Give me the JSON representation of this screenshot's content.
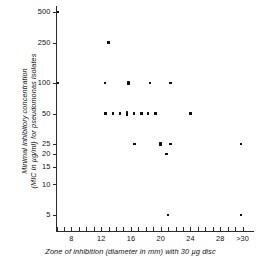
{
  "chart_data": {
    "type": "scatter",
    "title": "",
    "xlabel": "Zone of inhibition (diameter in mm) with 30 µg disc",
    "ylabel_line1": "Minimal inhibitory concentration",
    "ylabel_line2": "(MIC in µg/ml) for pseudomonas isolates",
    "yscale": "log",
    "ytick_labels": [
      "500",
      "250",
      "100",
      "50",
      "25",
      "20",
      "15",
      "10",
      "5"
    ],
    "ytick_values": [
      500,
      250,
      100,
      50,
      25,
      20,
      15,
      10,
      5
    ],
    "xtick_labels": [
      "8",
      "12",
      "16",
      "20",
      "24",
      "28",
      ">30"
    ],
    "xtick_values": [
      8,
      12,
      16,
      20,
      24,
      28,
      31
    ],
    "xlim": [
      6,
      32
    ],
    "ylim": [
      4,
      600
    ],
    "grid": false,
    "legend": null,
    "marker": "square",
    "marker_color": "#0d0d0d",
    "points": [
      {
        "x": 6.2,
        "y": 500,
        "count": 1
      },
      {
        "x": 13.0,
        "y": 250,
        "count": 1
      },
      {
        "x": 6.2,
        "y": 100,
        "count": 1
      },
      {
        "x": 12.5,
        "y": 100,
        "count": 1
      },
      {
        "x": 15.7,
        "y": 100,
        "count": 2
      },
      {
        "x": 18.6,
        "y": 100,
        "count": 1
      },
      {
        "x": 21.3,
        "y": 100,
        "count": 1
      },
      {
        "x": 12.6,
        "y": 50,
        "count": 1
      },
      {
        "x": 13.6,
        "y": 50,
        "count": 1
      },
      {
        "x": 14.5,
        "y": 50,
        "count": 1
      },
      {
        "x": 15.5,
        "y": 50,
        "count": 2
      },
      {
        "x": 16.4,
        "y": 50,
        "count": 1
      },
      {
        "x": 17.4,
        "y": 50,
        "count": 1
      },
      {
        "x": 18.3,
        "y": 50,
        "count": 1
      },
      {
        "x": 19.3,
        "y": 50,
        "count": 1
      },
      {
        "x": 24.0,
        "y": 50,
        "count": 1
      },
      {
        "x": 16.5,
        "y": 25,
        "count": 1
      },
      {
        "x": 20.0,
        "y": 25,
        "count": 2
      },
      {
        "x": 21.3,
        "y": 25,
        "count": 1
      },
      {
        "x": 30.8,
        "y": 25,
        "count": 1
      },
      {
        "x": 20.8,
        "y": 20,
        "count": 1
      },
      {
        "x": 21.0,
        "y": 5,
        "count": 1
      },
      {
        "x": 30.8,
        "y": 5,
        "count": 1
      }
    ]
  }
}
